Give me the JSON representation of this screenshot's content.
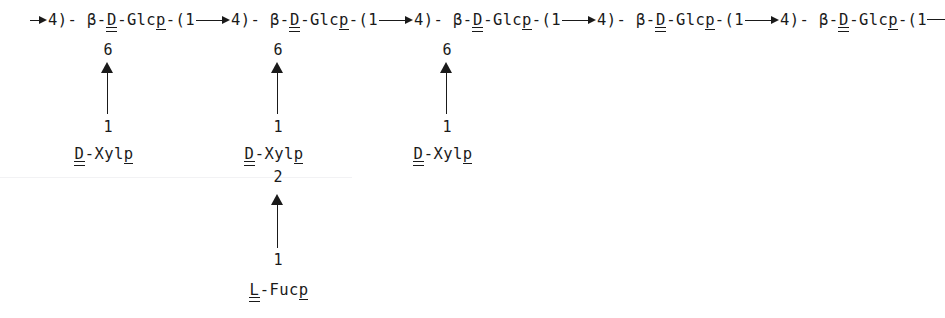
{
  "diagram": {
    "type": "carbohydrate-structure",
    "text_color": "#1a1a1a",
    "background_color": "#ffffff",
    "backbone": {
      "leading_symbol": "→",
      "leading_position": "4)",
      "trailing_symbol": "—",
      "units": [
        {
          "anomeric": "β",
          "config": "D",
          "sugar": "Glc",
          "ring": "p",
          "linkage_open": "-(1",
          "linkage_arrow": "→",
          "linkage_position": "4)",
          "separator": "-",
          "branch_position": "6"
        },
        {
          "anomeric": "β",
          "config": "D",
          "sugar": "Glc",
          "ring": "p",
          "linkage_open": "-(1",
          "linkage_arrow": "→",
          "linkage_position": "4)",
          "separator": "-",
          "branch_position": "6"
        },
        {
          "anomeric": "β",
          "config": "D",
          "sugar": "Glc",
          "ring": "p",
          "linkage_open": "-(1",
          "linkage_arrow": "→",
          "linkage_position": "4)",
          "separator": "-",
          "branch_position": "6"
        },
        {
          "anomeric": "β",
          "config": "D",
          "sugar": "Glc",
          "ring": "p",
          "linkage_open": "-(1",
          "linkage_arrow": "→",
          "linkage_position": "4)",
          "separator": "-",
          "branch_position": ""
        },
        {
          "anomeric": "β",
          "config": "D",
          "sugar": "Glc",
          "ring": "p",
          "linkage_open": "-(1",
          "linkage_arrow": "—",
          "linkage_position": "",
          "separator": "",
          "branch_position": ""
        }
      ]
    },
    "branches": [
      {
        "id": "branch-1",
        "attach_position": "6",
        "anomeric_carbon": "1",
        "residue_config": "D",
        "residue_name": "Xyl",
        "residue_ring": "p",
        "sub_position": "",
        "sub_anomeric_carbon": "",
        "sub_config": "",
        "sub_name": "",
        "sub_ring": ""
      },
      {
        "id": "branch-2",
        "attach_position": "6",
        "anomeric_carbon": "1",
        "residue_config": "D",
        "residue_name": "Xyl",
        "residue_ring": "p",
        "sub_position": "2",
        "sub_anomeric_carbon": "1",
        "sub_config": "L",
        "sub_name": "Fuc",
        "sub_ring": "p"
      },
      {
        "id": "branch-3",
        "attach_position": "6",
        "anomeric_carbon": "1",
        "residue_config": "D",
        "residue_name": "Xyl",
        "residue_ring": "p",
        "sub_position": "",
        "sub_anomeric_carbon": "",
        "sub_config": "",
        "sub_name": "",
        "sub_ring": ""
      }
    ],
    "separators": {
      "dash": "-",
      "hyphen": "-"
    }
  }
}
